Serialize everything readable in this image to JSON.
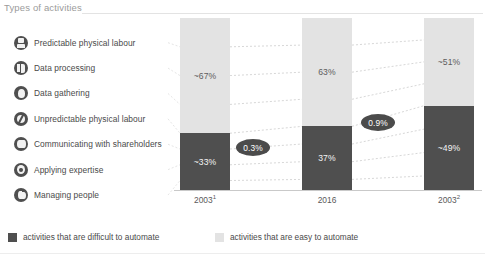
{
  "header": {
    "title": "Types of activities"
  },
  "activities": [
    {
      "label": "Predictable physical labour",
      "icon": "robot-icon"
    },
    {
      "label": "Data processing",
      "icon": "data-processing-icon"
    },
    {
      "label": "Data gathering",
      "icon": "data-gathering-icon"
    },
    {
      "label": "Unpredictable physical labour",
      "icon": "unpredictable-labour-icon"
    },
    {
      "label": "Communicating with shareholders",
      "icon": "communication-icon"
    },
    {
      "label": "Applying expertise",
      "icon": "expertise-icon"
    },
    {
      "label": "Managing people",
      "icon": "managing-people-icon"
    }
  ],
  "legend": {
    "hard_label": "activities that are difficult to automate",
    "easy_label": "activities that are easy to automate",
    "hard_color": "#4f4f4f",
    "easy_color": "#e3e3e3"
  },
  "bubbles": [
    {
      "value": "0.3%"
    },
    {
      "value": "0.9%"
    }
  ],
  "chart_data": {
    "type": "bar",
    "title": "Types of activities",
    "xlabel": "",
    "ylabel": "",
    "ylim": [
      0,
      100
    ],
    "grid": false,
    "stacked": true,
    "legend_position": "bottom",
    "categories": [
      "2003¹",
      "2016",
      "2003²"
    ],
    "category_labels_plain": [
      "2003",
      "2016",
      "2003"
    ],
    "category_footnotes": [
      "1",
      "",
      "2"
    ],
    "series": [
      {
        "name": "activities that are easy to automate",
        "color": "#e3e3e3",
        "values": [
          67,
          63,
          51
        ],
        "labels": [
          "~67%",
          "63%",
          "~51%"
        ]
      },
      {
        "name": "activities that are difficult to automate",
        "color": "#4f4f4f",
        "values": [
          33,
          37,
          49
        ],
        "labels": [
          "~33%",
          "37%",
          "~49%"
        ]
      }
    ],
    "annotations": [
      {
        "text": "0.3%",
        "between": [
          "2003¹",
          "2016"
        ]
      },
      {
        "text": "0.9%",
        "between": [
          "2016",
          "2003²"
        ]
      }
    ]
  }
}
